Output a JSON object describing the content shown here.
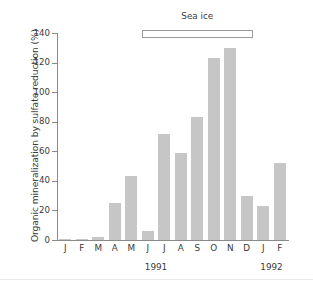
{
  "chart_data": {
    "type": "bar",
    "title": "",
    "xlabel": "",
    "ylabel": "Organic mineralization by sulfate reduction (%)",
    "ylim": [
      0,
      140
    ],
    "yticks": [
      0,
      20,
      40,
      60,
      80,
      100,
      120,
      140
    ],
    "ytick_labels": [
      "0",
      "20",
      "40",
      "60",
      "80",
      "100",
      "120",
      "140"
    ],
    "grid": false,
    "legend": null,
    "categories": [
      "J",
      "F",
      "M",
      "A",
      "M",
      "J",
      "J",
      "A",
      "S",
      "O",
      "N",
      "D",
      "J",
      "F"
    ],
    "values": [
      1,
      1,
      2,
      25,
      43,
      6,
      72,
      59,
      83,
      123,
      130,
      30,
      23,
      52
    ],
    "bar_color": "#c6c6c6",
    "axis_color": "#8a8a8a",
    "text_color": "#3a3a3a",
    "group_labels": [
      {
        "text": "1991",
        "start_category_index": 0,
        "end_category_index": 11
      },
      {
        "text": "1992",
        "start_category_index": 12,
        "end_category_index": 13
      }
    ],
    "annotations": [
      {
        "text": "Sea ice",
        "type": "span-bar",
        "start_category_index": 5,
        "end_category_index": 11,
        "y_value": 140
      }
    ]
  },
  "figure": {
    "background": "#ffffff"
  }
}
